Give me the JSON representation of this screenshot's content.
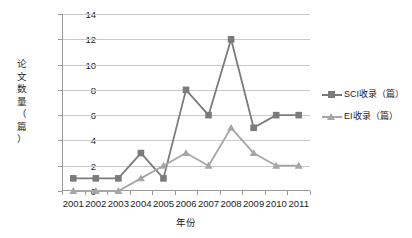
{
  "chart_data": {
    "type": "line",
    "title": "",
    "xlabel": "年份",
    "ylabel": "论文数量（篇）",
    "categories": [
      "2001",
      "2002",
      "2003",
      "2004",
      "2005",
      "2006",
      "2007",
      "2008",
      "2009",
      "2010",
      "2011"
    ],
    "series": [
      {
        "name": "SCI收录（篇）",
        "marker": "square",
        "color": "#7b7b7b",
        "values": [
          1,
          1,
          1,
          3,
          1,
          8,
          6,
          12,
          5,
          6,
          6
        ]
      },
      {
        "name": "EI收录（篇）",
        "marker": "triangle",
        "color": "#a6a6a6",
        "values": [
          0,
          0,
          0,
          1,
          2,
          3,
          2,
          5,
          3,
          2,
          2
        ]
      }
    ],
    "ylim": [
      0,
      14
    ],
    "yticks": [
      0,
      2,
      4,
      6,
      8,
      10,
      12,
      14
    ],
    "grid": true,
    "legend_position": "right"
  },
  "axis": {
    "y_title_chars": [
      "论",
      "文",
      "数",
      "量",
      "（",
      "篇",
      "）"
    ]
  },
  "colors": {
    "sci": "#7b7b7b",
    "ei": "#a6a6a6",
    "grid": "#c9c9c9",
    "axis": "#9a9a9a",
    "text": "#1d1d1d",
    "background": "#ffffff"
  }
}
